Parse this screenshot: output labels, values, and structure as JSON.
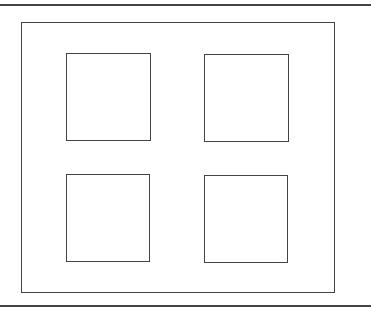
{
  "diagram": {
    "type": "window-frame-floorplan",
    "stroke_color": "#444444",
    "background": "#ffffff",
    "top_rule": {
      "y": 4
    },
    "bottom_rule": {
      "y": 305
    },
    "outer_frame": {
      "x": 21,
      "y": 22,
      "w": 314,
      "h": 271
    },
    "panes": [
      {
        "id": "top-left",
        "x": 66,
        "y": 53,
        "w": 85,
        "h": 88
      },
      {
        "id": "top-right",
        "x": 204,
        "y": 54,
        "w": 85,
        "h": 88
      },
      {
        "id": "bottom-left",
        "x": 66,
        "y": 174,
        "w": 84,
        "h": 88
      },
      {
        "id": "bottom-right",
        "x": 204,
        "y": 175,
        "w": 84,
        "h": 88
      }
    ]
  }
}
